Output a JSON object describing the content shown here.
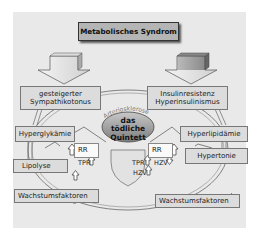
{
  "title": "Metabolisches Syndrom",
  "left_branch": {
    "cause": [
      "gesteigerter",
      "Sympathikotonus"
    ],
    "effects": [
      {
        "label": "Hyperglykämie",
        "arrow": ""
      },
      {
        "label": "Lipolyse",
        "arrow": "up"
      },
      {
        "label": "Wachstumsfaktoren",
        "arrow": "up"
      }
    ],
    "hemodynamics": {
      "rr": {
        "label": "RR",
        "arrow": "up"
      },
      "tpr": {
        "label": "TPR",
        "arrow": "up"
      }
    }
  },
  "right_branch": {
    "cause": [
      "Insulinresistenz",
      "Hyperinsulinismus"
    ],
    "effects": [
      {
        "label": "Hyperlipidämie",
        "arrow": ""
      },
      {
        "label": "Hypertonie",
        "arrow": ""
      },
      {
        "label": "Wachstumsfaktoren",
        "arrow": "up"
      }
    ],
    "hemodynamics": {
      "rr": {
        "label": "RR",
        "arrow": "up"
      },
      "tpr": {
        "label": "TPR",
        "arrow": "up"
      },
      "hzv1": {
        "label": "HZV",
        "arrow": "down"
      },
      "hzv2": {
        "label": "HZV",
        "arrow": "up"
      }
    }
  },
  "center": {
    "arc_label": "Arteriosklerose",
    "ellipse_lines": [
      "das",
      "tödliche",
      "Quintett"
    ]
  },
  "colors": {
    "panel": "#e9e9e9",
    "box": "#dcdcdc",
    "title_box": "#b5b5b5",
    "ellipse": "#9a9a9a"
  }
}
